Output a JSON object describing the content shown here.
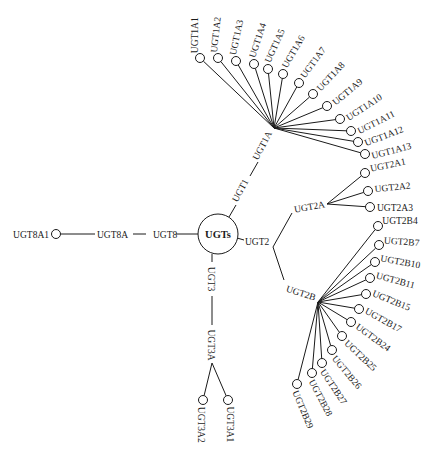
{
  "diagram": {
    "root": {
      "label": "UGTs",
      "x": 218,
      "y": 234,
      "r": 20
    },
    "families": [
      {
        "label": "UGT1",
        "subfamilies": [
          {
            "label": "UGT1A",
            "hub": [
              274,
              128
            ],
            "members": [
              "UGT1A1",
              "UGT1A2",
              "UGT1A3",
              "UGT1A4",
              "UGT1A5",
              "UGT1A6",
              "UGT1A7",
              "UGT1A8",
              "UGT1A9",
              "UGT1A10",
              "UGT1A11",
              "UGT1A12",
              "UGT1A13"
            ]
          }
        ]
      },
      {
        "label": "UGT2",
        "subfamilies": [
          {
            "label": "UGT2A",
            "hub": [
              327,
              204
            ],
            "members": [
              "UGT2A1",
              "UGT2A2",
              "UGT2A3"
            ]
          },
          {
            "label": "UGT2B",
            "hub": [
              318,
              302
            ],
            "members": [
              "UGT2B4",
              "UGT2B7",
              "UGT2B10",
              "UGT2B11",
              "UGT2B15",
              "UGT2B17",
              "UGT2B24",
              "UGT2B25",
              "UGT2B26",
              "UGT2B27",
              "UGT2B28",
              "UGT2B29"
            ]
          }
        ]
      },
      {
        "label": "UGT3",
        "subfamilies": [
          {
            "label": "UGT3A",
            "hub": [
              212,
              363
            ],
            "members": [
              "UGT3A2",
              "UGT3A1"
            ]
          }
        ]
      },
      {
        "label": "UGT8",
        "subfamilies": [
          {
            "label": "UGT8A",
            "members": [
              "UGT8A1"
            ]
          }
        ]
      }
    ],
    "labels": {
      "root": "UGTs",
      "ugt1": "UGT1",
      "ugt1a": "UGT1A",
      "ugt2": "UGT2",
      "ugt2a": "UGT2A",
      "ugt2b": "UGT2B",
      "ugt3": "UGT3",
      "ugt3a": "UGT3A",
      "ugt8": "UGT8",
      "ugt8a": "UGT8A",
      "ugt8a1": "UGT8A1"
    },
    "leaves": {
      "ugt1a": [
        {
          "label": "UGT1A1",
          "x": 200,
          "y": 58,
          "angle": -90
        },
        {
          "label": "UGT1A2",
          "x": 218,
          "y": 58,
          "angle": -84
        },
        {
          "label": "UGT1A3",
          "x": 236,
          "y": 61,
          "angle": -78
        },
        {
          "label": "UGT1A4",
          "x": 254,
          "y": 64,
          "angle": -72
        },
        {
          "label": "UGT1A5",
          "x": 268,
          "y": 69,
          "angle": -66
        },
        {
          "label": "UGT1A6",
          "x": 283,
          "y": 74,
          "angle": -60
        },
        {
          "label": "UGT1A7",
          "x": 299,
          "y": 83,
          "angle": -54
        },
        {
          "label": "UGT1A8",
          "x": 313,
          "y": 94,
          "angle": -47
        },
        {
          "label": "UGT1A9",
          "x": 327,
          "y": 106,
          "angle": -40
        },
        {
          "label": "UGT1A10",
          "x": 340,
          "y": 119,
          "angle": -33
        },
        {
          "label": "UGT1A11",
          "x": 351,
          "y": 131,
          "angle": -27
        },
        {
          "label": "UGT1A12",
          "x": 358,
          "y": 142,
          "angle": -21
        },
        {
          "label": "UGT1A13",
          "x": 365,
          "y": 154,
          "angle": -15
        }
      ],
      "ugt2a": [
        {
          "label": "UGT2A1",
          "x": 365,
          "y": 173,
          "angle": -12
        },
        {
          "label": "UGT2A2",
          "x": 368,
          "y": 191,
          "angle": -6
        },
        {
          "label": "UGT2A3",
          "x": 370,
          "y": 207,
          "angle": 0
        }
      ],
      "ugt2b": [
        {
          "label": "UGT2B4",
          "x": 378,
          "y": 226,
          "angle": 0
        },
        {
          "label": "UGT2B7",
          "x": 379,
          "y": 245,
          "angle": 4
        },
        {
          "label": "UGT2B10",
          "x": 375,
          "y": 262,
          "angle": 10
        },
        {
          "label": "UGT2B11",
          "x": 370,
          "y": 278,
          "angle": 15
        },
        {
          "label": "UGT2B15",
          "x": 366,
          "y": 294,
          "angle": 22
        },
        {
          "label": "UGT2B17",
          "x": 359,
          "y": 309,
          "angle": 29
        },
        {
          "label": "UGT2B24",
          "x": 351,
          "y": 322,
          "angle": 36
        },
        {
          "label": "UGT2B25",
          "x": 342,
          "y": 336,
          "angle": 43
        },
        {
          "label": "UGT2B26",
          "x": 332,
          "y": 350,
          "angle": 50
        },
        {
          "label": "UGT2B27",
          "x": 322,
          "y": 363,
          "angle": 56
        },
        {
          "label": "UGT2B28",
          "x": 312,
          "y": 373,
          "angle": 62
        },
        {
          "label": "UGT2B29",
          "x": 297,
          "y": 384,
          "angle": 67
        }
      ],
      "ugt3a": [
        {
          "label": "UGT3A2",
          "x": 203,
          "y": 400,
          "angle": 90
        },
        {
          "label": "UGT3A1",
          "x": 228,
          "y": 400,
          "angle": 90
        }
      ]
    }
  }
}
